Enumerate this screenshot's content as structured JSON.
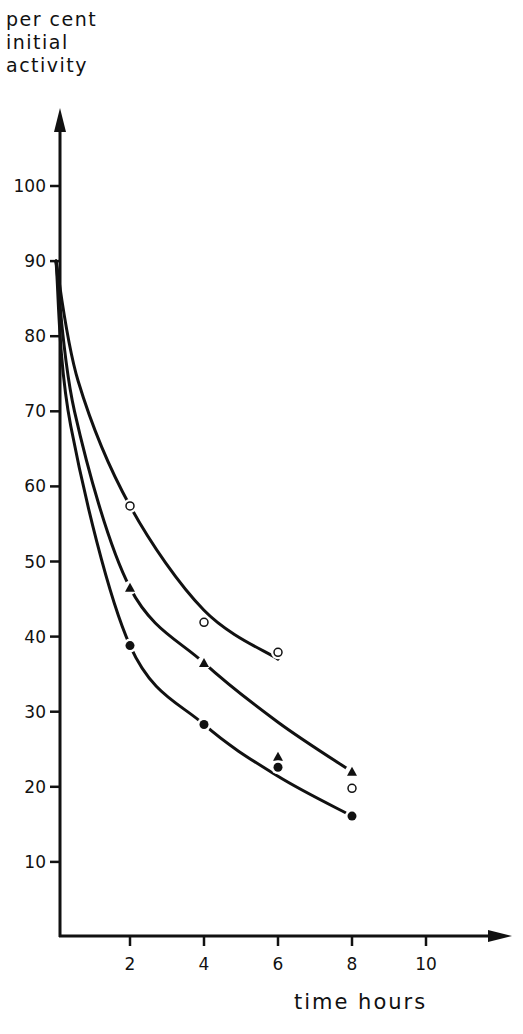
{
  "chart_data": {
    "type": "line",
    "title": "",
    "ylabel_lines": [
      "per cent",
      "initial",
      "activity"
    ],
    "ylabel": "per cent initial activity",
    "xlabel": "time hours",
    "xlim": [
      0,
      12
    ],
    "ylim": [
      0,
      110
    ],
    "xticks": [
      2,
      4,
      6,
      8,
      10
    ],
    "yticks": [
      10,
      20,
      30,
      40,
      50,
      60,
      70,
      80,
      90,
      100
    ],
    "grid": false,
    "legend": null,
    "series": [
      {
        "name": "open circles",
        "marker": "open-circle",
        "curve_start": [
          0,
          90
        ],
        "points": [
          [
            2,
            57.4
          ],
          [
            4,
            41.9
          ],
          [
            6,
            37.9
          ],
          [
            8,
            19.8
          ]
        ],
        "curve_end": [
          6,
          37
        ]
      },
      {
        "name": "filled triangles",
        "marker": "filled-triangle",
        "curve_start": [
          0,
          90
        ],
        "points": [
          [
            2,
            46.5
          ],
          [
            4,
            36.5
          ],
          [
            6,
            24.0
          ],
          [
            8,
            22.0
          ]
        ],
        "curve_end": [
          8,
          22
        ]
      },
      {
        "name": "filled circles",
        "marker": "filled-circle",
        "curve_start": [
          0,
          90
        ],
        "points": [
          [
            2,
            38.8
          ],
          [
            4,
            28.3
          ],
          [
            6,
            22.6
          ],
          [
            8,
            16.1
          ]
        ],
        "curve_end": [
          8,
          16.1
        ]
      }
    ]
  }
}
